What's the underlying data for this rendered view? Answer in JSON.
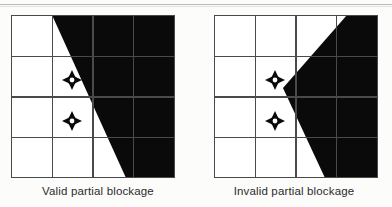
{
  "figure": {
    "title_visible": false,
    "background_color": "#fcfcfb",
    "rule_color": "#b9b9b4",
    "grid_line_color": "#4a4a4a",
    "blockage_fill_color": "#0a0a0a",
    "cell_fill_color": "#ffffff",
    "marker_name": "four-point-star-target-marker"
  },
  "panels": [
    {
      "id": "valid",
      "caption": "Valid partial blockage",
      "grid": {
        "columns": 4,
        "rows": 4,
        "x": 11,
        "y": 15,
        "width": 164,
        "height": 163
      },
      "blockage_polygon": "52,15 175,15 175,178 126,178",
      "markers": [
        {
          "cx": 72,
          "cy": 80,
          "label": ""
        },
        {
          "cx": 72,
          "cy": 121,
          "label": ""
        }
      ]
    },
    {
      "id": "invalid",
      "caption": "Invalid partial blockage",
      "grid": {
        "columns": 4,
        "rows": 4,
        "x": 214,
        "y": 15,
        "width": 164,
        "height": 163
      },
      "blockage_polygon": "347,15 378,15 378,178 325,178 283,88",
      "markers": [
        {
          "cx": 275,
          "cy": 80,
          "label": ""
        },
        {
          "cx": 275,
          "cy": 121,
          "label": ""
        }
      ]
    }
  ]
}
